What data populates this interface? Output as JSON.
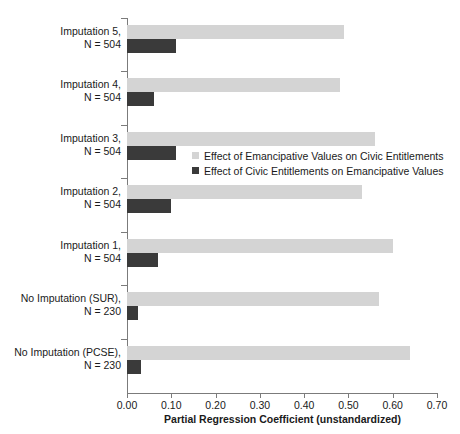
{
  "chart_data": {
    "type": "bar",
    "orientation": "horizontal",
    "title": "",
    "subtitle": "",
    "xlabel": "Partial Regression Coefficient (unstandardized)",
    "ylabel": "",
    "xlim": [
      0.0,
      0.7
    ],
    "xticks": [
      0.0,
      0.1,
      0.2,
      0.3,
      0.4,
      0.5,
      0.6,
      0.7
    ],
    "xticklabels": [
      "0.00",
      "0.10",
      "0.20",
      "0.30",
      "0.40",
      "0.50",
      "0.60",
      "0.70"
    ],
    "grid": false,
    "legend_position": "center-right-inside",
    "categories": [
      "Imputation 5, N = 504",
      "Imputation 4, N = 504",
      "Imputation 3, N = 504",
      "Imputation 2, N = 504",
      "Imputation 1, N = 504",
      "No Imputation (SUR), N = 230",
      "No Imputation (PCSE), N = 230"
    ],
    "category_lines": [
      [
        "Imputation 5,",
        "N = 504"
      ],
      [
        "Imputation 4,",
        "N = 504"
      ],
      [
        "Imputation 3,",
        "N = 504"
      ],
      [
        "Imputation 2,",
        "N = 504"
      ],
      [
        "Imputation 1,",
        "N = 504"
      ],
      [
        "No Imputation (SUR),",
        "N = 230"
      ],
      [
        "No Imputation (PCSE),",
        "N = 230"
      ]
    ],
    "series": [
      {
        "name": "Effect of Emancipative Values on Civic Entitlements",
        "color": "#d4d4d4",
        "values": [
          0.49,
          0.48,
          0.56,
          0.53,
          0.6,
          0.57,
          0.64
        ]
      },
      {
        "name": "Effect of Civic Entitlements on Emancipative Values",
        "color": "#3a3a3a",
        "values": [
          0.11,
          0.06,
          0.11,
          0.1,
          0.07,
          0.025,
          0.032
        ]
      }
    ]
  },
  "colors": {
    "light_series": "#d4d4d4",
    "dark_series": "#3a3a3a",
    "axis": "#7b7b7b",
    "text": "#1a1a1a",
    "background": "#ffffff"
  }
}
